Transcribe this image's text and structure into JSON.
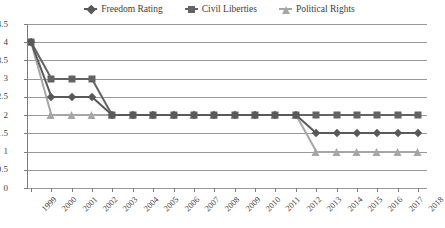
{
  "chart_data": {
    "type": "line",
    "title": "",
    "xlabel": "",
    "ylabel": "",
    "ylim": [
      0,
      4.5
    ],
    "ytick_step": 0.5,
    "grid": true,
    "legend_position": "top-center",
    "categories": [
      "1999",
      "2000",
      "2001",
      "2002",
      "2003",
      "2004",
      "2005",
      "2006",
      "2007",
      "2008",
      "2009",
      "2010",
      "2011",
      "2012",
      "2013",
      "2014",
      "2015",
      "2016",
      "2017",
      "2018"
    ],
    "yticks": [
      "0",
      "0.5",
      "1",
      "1.5",
      "2",
      "2.5",
      "3",
      "3.5",
      "4",
      "4.5"
    ],
    "series": [
      {
        "name": "Freedom Rating",
        "marker": "diamond-marker",
        "color": "#595959",
        "values": [
          4,
          2.5,
          2.5,
          2.5,
          2,
          2,
          2,
          2,
          2,
          2,
          2,
          2,
          2,
          2,
          1.5,
          1.5,
          1.5,
          1.5,
          1.5,
          1.5
        ]
      },
      {
        "name": "Civil Liberties",
        "marker": "square-marker",
        "color": "#636363",
        "values": [
          4,
          3,
          3,
          3,
          2,
          2,
          2,
          2,
          2,
          2,
          2,
          2,
          2,
          2,
          2,
          2,
          2,
          2,
          2,
          2
        ]
      },
      {
        "name": "Political Rights",
        "marker": "triangle-marker",
        "color": "#a6a6a6",
        "values": [
          4,
          2,
          2,
          2,
          2,
          2,
          2,
          2,
          2,
          2,
          2,
          2,
          2,
          2,
          1,
          1,
          1,
          1,
          1,
          1
        ]
      }
    ]
  }
}
